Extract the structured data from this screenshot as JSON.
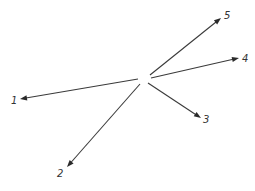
{
  "diagram": {
    "type": "vector-star",
    "origin": [
      144,
      80
    ],
    "stroke_color": "#3a3a3a",
    "label_color": "#333333",
    "vectors": [
      {
        "id": "1",
        "label": "1",
        "from": [
          138,
          79
        ],
        "to": [
          20,
          99
        ],
        "label_pos": [
          11,
          104
        ]
      },
      {
        "id": "2",
        "label": "2",
        "from": [
          140,
          84
        ],
        "to": [
          67,
          167
        ],
        "label_pos": [
          57,
          177
        ]
      },
      {
        "id": "3",
        "label": "3",
        "from": [
          148,
          83
        ],
        "to": [
          201,
          118
        ],
        "label_pos": [
          203,
          123
        ]
      },
      {
        "id": "4",
        "label": "4",
        "from": [
          151,
          78
        ],
        "to": [
          239,
          58
        ],
        "label_pos": [
          242,
          62
        ]
      },
      {
        "id": "5",
        "label": "5",
        "from": [
          150,
          75
        ],
        "to": [
          221,
          18
        ],
        "label_pos": [
          224,
          19
        ]
      }
    ]
  }
}
